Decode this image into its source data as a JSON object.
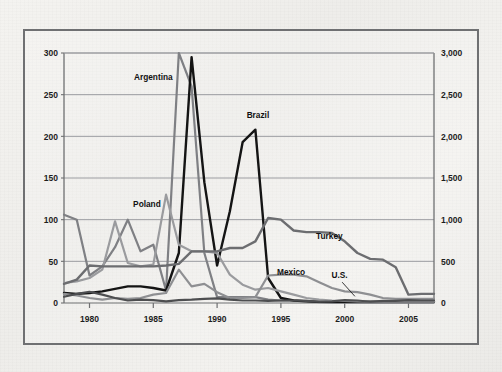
{
  "figure": {
    "background_color": "#f2f1ee",
    "frame_color": "#6f7072",
    "plot_background": "#eeedea"
  },
  "chart_data": {
    "type": "line",
    "title": "",
    "subtitle": "",
    "xlabel": "",
    "ylabel": "",
    "y2label": "",
    "grid": true,
    "legend_position": "inline-annotations",
    "xlim": [
      1978,
      2007
    ],
    "ylim": [
      0,
      300
    ],
    "y2lim": [
      0,
      3000
    ],
    "x_ticks": [
      1980,
      1985,
      1990,
      1995,
      2000,
      2005
    ],
    "x_tick_labels": [
      "1980",
      "1985",
      "1990",
      "1995",
      "2000",
      "2005"
    ],
    "y_ticks": [
      0,
      50,
      100,
      150,
      200,
      250,
      300
    ],
    "y_tick_labels": [
      "0",
      "50",
      "100",
      "150",
      "200",
      "250",
      "300"
    ],
    "y2_ticks": [
      0,
      500,
      1000,
      1500,
      2000,
      2500,
      3000
    ],
    "y2_tick_labels": [
      "0",
      "500",
      "1,000",
      "1,500",
      "2,000",
      "2,500",
      "3,000"
    ],
    "x": [
      1978,
      1979,
      1980,
      1981,
      1982,
      1983,
      1984,
      1985,
      1986,
      1987,
      1988,
      1989,
      1990,
      1991,
      1992,
      1993,
      1994,
      1995,
      1996,
      1997,
      1998,
      1999,
      2000,
      2001,
      2002,
      2003,
      2004,
      2005,
      2006,
      2007
    ],
    "series": [
      {
        "name": "Argentina",
        "axis": "right",
        "color": "#7f8084",
        "width": 2.2,
        "label_x": 1985.0,
        "label_y": 268,
        "values": [
          1060,
          1000,
          330,
          440,
          670,
          1000,
          620,
          700,
          150,
          3000,
          2600,
          600,
          70,
          70,
          70,
          70,
          40,
          30,
          30,
          25,
          10,
          5,
          5,
          5,
          5,
          5,
          5,
          5,
          5,
          5
        ]
      },
      {
        "name": "Brazil",
        "axis": "right",
        "color": "#141414",
        "width": 2.4,
        "label_x": 1993.2,
        "label_y": 222,
        "values": [
          120,
          110,
          120,
          140,
          170,
          200,
          200,
          180,
          150,
          600,
          2950,
          1450,
          450,
          1100,
          1930,
          2080,
          300,
          60,
          30,
          20,
          15,
          15,
          15,
          15,
          15,
          15,
          15,
          15,
          15,
          15
        ]
      },
      {
        "name": "Poland",
        "axis": "right",
        "color": "#9a9b9e",
        "width": 2.2,
        "label_x": 1984.5,
        "label_y": 115,
        "values": [
          240,
          260,
          300,
          400,
          980,
          480,
          440,
          460,
          1300,
          700,
          620,
          620,
          600,
          340,
          220,
          160,
          180,
          140,
          100,
          60,
          40,
          30,
          25,
          20,
          15,
          15,
          15,
          15,
          15,
          15
        ]
      },
      {
        "name": "Turkey",
        "axis": "right",
        "color": "#6c6d70",
        "width": 2.4,
        "label_x": 1998.8,
        "label_y": 77,
        "values": [
          230,
          280,
          450,
          440,
          440,
          440,
          440,
          440,
          450,
          470,
          620,
          620,
          620,
          660,
          660,
          740,
          1020,
          1000,
          870,
          850,
          850,
          840,
          740,
          600,
          530,
          520,
          430,
          100,
          110,
          110
        ]
      },
      {
        "name": "Mexico",
        "axis": "right",
        "color": "#8e8f92",
        "width": 2.2,
        "label_x": 1995.8,
        "label_y": 34,
        "values": [
          110,
          90,
          60,
          40,
          60,
          50,
          60,
          100,
          120,
          400,
          200,
          230,
          130,
          60,
          60,
          70,
          330,
          340,
          340,
          320,
          250,
          180,
          140,
          130,
          100,
          60,
          50,
          50,
          50,
          50
        ]
      },
      {
        "name": "U.S.",
        "axis": "right",
        "color": "#4d4e50",
        "width": 2.2,
        "label_x": 1999.6,
        "label_y": 30,
        "leader_from": [
          1999.8,
          25
        ],
        "leader_to": [
          2000.8,
          8
        ],
        "values": [
          75,
          110,
          135,
          100,
          60,
          30,
          40,
          35,
          20,
          35,
          40,
          50,
          55,
          40,
          30,
          30,
          25,
          30,
          30,
          25,
          15,
          20,
          35,
          30,
          15,
          25,
          25,
          35,
          30,
          30
        ]
      }
    ],
    "annotations": [
      {
        "text": "Argentina"
      },
      {
        "text": "Brazil"
      },
      {
        "text": "Poland"
      },
      {
        "text": "Turkey"
      },
      {
        "text": "Mexico"
      },
      {
        "text": "U.S."
      }
    ]
  }
}
